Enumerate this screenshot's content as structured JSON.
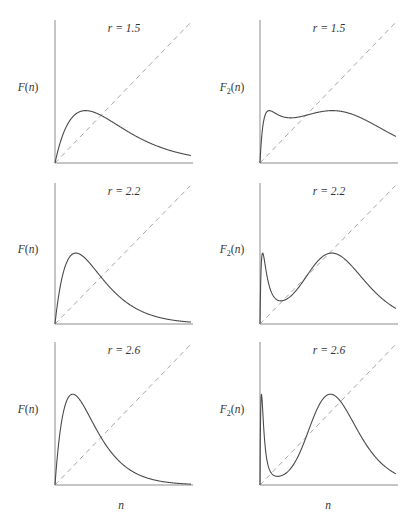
{
  "figure": {
    "x_axis_label": "n",
    "y_axis_labels": {
      "left_column": "F(n)",
      "right_column": "F2(n)"
    },
    "colors": {
      "curve": "#4a4a4a",
      "diagonal": "#a6a6a6",
      "axis": "#8c8c8c",
      "background": "#ffffff"
    }
  },
  "panels": [
    {
      "id": "p1",
      "row": 0,
      "col": 0,
      "title": "r = 1.5",
      "r": 1.5,
      "ylabel": "F(n)",
      "iterate": 1
    },
    {
      "id": "p2",
      "row": 0,
      "col": 1,
      "title": "r = 1.5",
      "r": 1.5,
      "ylabel": "F2(n)",
      "iterate": 2
    },
    {
      "id": "p3",
      "row": 1,
      "col": 0,
      "title": "r = 2.2",
      "r": 2.2,
      "ylabel": "F(n)",
      "iterate": 1
    },
    {
      "id": "p4",
      "row": 1,
      "col": 1,
      "title": "r = 2.2",
      "r": 2.2,
      "ylabel": "F2(n)",
      "iterate": 2
    },
    {
      "id": "p5",
      "row": 2,
      "col": 0,
      "title": "r = 2.6",
      "r": 2.6,
      "ylabel": "F(n)",
      "iterate": 1
    },
    {
      "id": "p6",
      "row": 2,
      "col": 1,
      "title": "r = 2.6",
      "r": 2.6,
      "ylabel": "F2(n)",
      "iterate": 2
    }
  ],
  "chart_data": [
    {
      "type": "line",
      "title": "r = 1.5",
      "xlabel": "n",
      "ylabel": "F(n)",
      "function": "F(n) = n * exp(r * (1 - n))",
      "r": 1.5,
      "xlim": [
        0,
        3
      ],
      "ylim": [
        0,
        3
      ],
      "grid": false,
      "ticks": false,
      "series": [
        {
          "name": "F(n)",
          "style": "solid",
          "x": [
            0,
            0.25,
            0.5,
            0.667,
            1.0,
            1.5,
            2.0,
            2.5,
            3.0
          ],
          "y": [
            0,
            0.77,
            1.06,
            1.1,
            1.0,
            0.71,
            0.45,
            0.26,
            0.15
          ]
        },
        {
          "name": "n (45-degree line)",
          "style": "dashed",
          "x": [
            0,
            3
          ],
          "y": [
            0,
            3
          ]
        }
      ]
    },
    {
      "type": "line",
      "title": "r = 1.5",
      "xlabel": "n",
      "ylabel": "F2(n)",
      "function": "F2(n) = F(F(n))",
      "r": 1.5,
      "xlim": [
        0,
        3
      ],
      "ylim": [
        0,
        3
      ],
      "grid": false,
      "ticks": false,
      "series": [
        {
          "name": "F2(n)",
          "style": "solid",
          "x": [
            0,
            0.1,
            0.25,
            0.667,
            1.0,
            1.5,
            2.0,
            2.5,
            3.0
          ],
          "y": [
            0,
            0.53,
            0.98,
            0.93,
            1.0,
            1.09,
            1.1,
            1.06,
            1.0
          ]
        },
        {
          "name": "n (45-degree line)",
          "style": "dashed",
          "x": [
            0,
            3
          ],
          "y": [
            0,
            3
          ]
        }
      ]
    },
    {
      "type": "line",
      "title": "r = 2.2",
      "xlabel": "n",
      "ylabel": "F(n)",
      "function": "F(n) = n * exp(r * (1 - n))",
      "r": 2.2,
      "xlim": [
        0,
        3
      ],
      "ylim": [
        0,
        3
      ],
      "grid": false,
      "ticks": false,
      "series": [
        {
          "name": "F(n)",
          "style": "solid",
          "x": [
            0,
            0.25,
            0.455,
            0.75,
            1.0,
            1.5,
            2.0,
            2.5,
            3.0
          ],
          "y": [
            0,
            1.3,
            1.51,
            1.3,
            1.0,
            0.5,
            0.22,
            0.09,
            0.04
          ]
        },
        {
          "name": "n (45-degree line)",
          "style": "dashed",
          "x": [
            0,
            3
          ],
          "y": [
            0,
            3
          ]
        }
      ]
    },
    {
      "type": "line",
      "title": "r = 2.2",
      "xlabel": "n",
      "ylabel": "F2(n)",
      "function": "F2(n) = F(F(n))",
      "r": 2.2,
      "xlim": [
        0,
        3
      ],
      "ylim": [
        0,
        3
      ],
      "grid": false,
      "ticks": false,
      "series": [
        {
          "name": "F2(n)",
          "style": "solid",
          "x": [
            0,
            0.1,
            0.455,
            0.75,
            1.0,
            1.5,
            2.0,
            2.5,
            3.0
          ],
          "y": [
            0,
            1.4,
            0.68,
            0.75,
            1.0,
            1.47,
            1.65,
            1.5,
            1.25
          ]
        },
        {
          "name": "n (45-degree line)",
          "style": "dashed",
          "x": [
            0,
            3
          ],
          "y": [
            0,
            3
          ]
        }
      ]
    },
    {
      "type": "line",
      "title": "r = 2.6",
      "xlabel": "n",
      "ylabel": "F(n)",
      "function": "F(n) = n * exp(r * (1 - n))",
      "r": 2.6,
      "xlim": [
        0,
        3
      ],
      "ylim": [
        0,
        3
      ],
      "grid": false,
      "ticks": false,
      "series": [
        {
          "name": "F(n)",
          "style": "solid",
          "x": [
            0,
            0.2,
            0.385,
            0.75,
            1.0,
            1.5,
            2.0,
            2.5,
            3.0
          ],
          "y": [
            0,
            1.6,
            1.87,
            1.43,
            1.0,
            0.41,
            0.15,
            0.05,
            0.02
          ]
        },
        {
          "name": "n (45-degree line)",
          "style": "dashed",
          "x": [
            0,
            3
          ],
          "y": [
            0,
            3
          ]
        }
      ]
    },
    {
      "type": "line",
      "title": "r = 2.6",
      "xlabel": "n",
      "ylabel": "F2(n)",
      "function": "F2(n) = F(F(n))",
      "r": 2.6,
      "xlim": [
        0,
        3
      ],
      "ylim": [
        0,
        3
      ],
      "grid": false,
      "ticks": false,
      "series": [
        {
          "name": "F2(n)",
          "style": "solid",
          "x": [
            0,
            0.08,
            0.385,
            0.6,
            1.0,
            1.5,
            2.0,
            2.5,
            3.0
          ],
          "y": [
            0,
            1.87,
            0.57,
            0.6,
            1.0,
            1.53,
            1.87,
            1.8,
            1.45
          ]
        },
        {
          "name": "n (45-degree line)",
          "style": "dashed",
          "x": [
            0,
            3
          ],
          "y": [
            0,
            3
          ]
        }
      ]
    }
  ]
}
